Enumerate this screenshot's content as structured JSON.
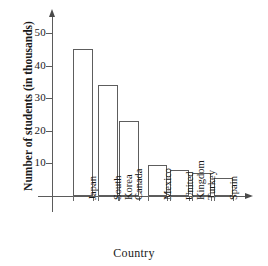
{
  "chart_data": {
    "type": "bar",
    "title": "",
    "xlabel": "Country",
    "ylabel": "Number of students (in thousands)",
    "categories": [
      "Japan",
      "South Korea",
      "Canada",
      "Mexico",
      "United Kingdom",
      "Turkey",
      "Spain"
    ],
    "values": [
      45,
      34,
      23,
      9.5,
      8,
      7,
      5.5
    ],
    "ylim": [
      0,
      55
    ],
    "yticks": [
      10,
      20,
      30,
      40,
      50
    ],
    "ytick_labels": [
      "10",
      "20",
      "30",
      "40",
      "50"
    ],
    "grid": false,
    "legend": null,
    "bar_fill": "#ffffff",
    "bar_stroke": "#5d5d5d",
    "axis_color": "#5b5b5b"
  },
  "axis": {
    "y_title": "Number of students (in thousands)",
    "x_title": "Country",
    "ticks": [
      {
        "label": "50",
        "value": 50
      },
      {
        "label": "40",
        "value": 40
      },
      {
        "label": "30",
        "value": 30
      },
      {
        "label": "20",
        "value": 20
      },
      {
        "label": "10",
        "value": 10
      }
    ]
  },
  "bars": [
    {
      "label_line1": "Japan",
      "label_line2": "",
      "value": 45
    },
    {
      "label_line1": "South",
      "label_line2": "Korea",
      "value": 34
    },
    {
      "label_line1": "Canada",
      "label_line2": "",
      "value": 23
    },
    {
      "label_line1": "Mexico",
      "label_line2": "",
      "value": 9.5
    },
    {
      "label_line1": "United",
      "label_line2": "Kingdom",
      "value": 8
    },
    {
      "label_line1": "Turkey",
      "label_line2": "",
      "value": 7
    },
    {
      "label_line1": "Spain",
      "label_line2": "",
      "value": 5.5
    }
  ]
}
